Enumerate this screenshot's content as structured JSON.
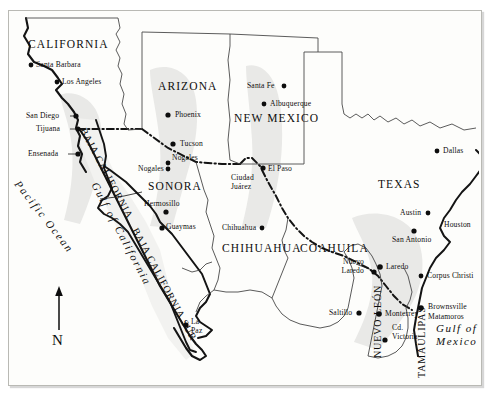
{
  "map": {
    "title": "US-Mexico Border Region Map",
    "frame": {
      "background": "#fdfdfb",
      "border_color": "#b9b9b4"
    },
    "compass": {
      "label": "N",
      "direction": "north"
    },
    "states_us": [
      {
        "name": "CALIFORNIA",
        "x": 28,
        "y": 44
      },
      {
        "name": "ARIZONA",
        "x": 158,
        "y": 86
      },
      {
        "name": "NEW MEXICO",
        "x": 234,
        "y": 118
      },
      {
        "name": "TEXAS",
        "x": 378,
        "y": 184
      }
    ],
    "states_mx": [
      {
        "name": "BAJA CALIFORNIA",
        "x": 88,
        "y": 130,
        "rotated": true
      },
      {
        "name": "BAJA CALIFORNIA SUR",
        "x": 118,
        "y": 238,
        "rotated": true
      },
      {
        "name": "SONORA",
        "x": 153,
        "y": 186
      },
      {
        "name": "CHIHUAHUA",
        "x": 228,
        "y": 248
      },
      {
        "name": "COAHUILA",
        "x": 305,
        "y": 248
      },
      {
        "name": "NUEVO LEÓN",
        "x": 368,
        "y": 292,
        "rotated": true
      },
      {
        "name": "TAMAULIPAS",
        "x": 412,
        "y": 300,
        "rotated": true
      }
    ],
    "cities_us": [
      {
        "name": "Santa Barbara",
        "x": 36,
        "y": 62,
        "dot_x": 31,
        "dot_y": 65,
        "anchor": "left"
      },
      {
        "name": "Los Angeles",
        "x": 62,
        "y": 79,
        "dot_x": 57,
        "dot_y": 82,
        "anchor": "left"
      },
      {
        "name": "San Diego",
        "x": 36,
        "y": 112,
        "dot_x": 76,
        "dot_y": 116,
        "anchor": "left"
      },
      {
        "name": "Phoenix",
        "x": 175,
        "y": 112,
        "dot_x": 168,
        "dot_y": 115,
        "anchor": "left"
      },
      {
        "name": "Tucson",
        "x": 180,
        "y": 141,
        "dot_x": 173,
        "dot_y": 144,
        "anchor": "left"
      },
      {
        "name": "Nogales",
        "x": 172,
        "y": 155,
        "dot_x": 168,
        "dot_y": 164,
        "anchor": "left"
      },
      {
        "name": "Santa Fe",
        "x": 247,
        "y": 83,
        "dot_x": 284,
        "dot_y": 86,
        "anchor": "left"
      },
      {
        "name": "Albuquerque",
        "x": 270,
        "y": 101,
        "dot_x": 264,
        "dot_y": 104,
        "anchor": "left"
      },
      {
        "name": "El Paso",
        "x": 268,
        "y": 166,
        "dot_x": 262,
        "dot_y": 169,
        "anchor": "left"
      },
      {
        "name": "Dallas",
        "x": 443,
        "y": 148,
        "dot_x": 437,
        "dot_y": 151,
        "anchor": "left"
      },
      {
        "name": "Austin",
        "x": 400,
        "y": 210,
        "dot_x": 428,
        "dot_y": 213,
        "anchor": "left"
      },
      {
        "name": "Houston",
        "x": 444,
        "y": 222,
        "dot_x": 483,
        "dot_y": 225,
        "anchor": "left"
      },
      {
        "name": "San Antonio",
        "x": 394,
        "y": 238,
        "dot_x": 414,
        "dot_y": 231,
        "anchor": "left"
      },
      {
        "name": "Laredo",
        "x": 386,
        "y": 264,
        "dot_x": 380,
        "dot_y": 267,
        "anchor": "left"
      },
      {
        "name": "Corpus Christi",
        "x": 427,
        "y": 273,
        "dot_x": 421,
        "dot_y": 276,
        "anchor": "left"
      },
      {
        "name": "Brownsville",
        "x": 428,
        "y": 305,
        "dot_x": 421,
        "dot_y": 310,
        "anchor": "left"
      }
    ],
    "cities_mx": [
      {
        "name": "Tijuana",
        "x": 39,
        "y": 126,
        "dot_x": 78,
        "dot_y": 129,
        "anchor": "left"
      },
      {
        "name": "Ensenada",
        "x": 33,
        "y": 151,
        "dot_x": 78,
        "dot_y": 154,
        "anchor": "left"
      },
      {
        "name": "Nogales",
        "x": 140,
        "y": 166,
        "dot_x": 168,
        "dot_y": 169,
        "anchor": "left"
      },
      {
        "name": "Hermosillo",
        "x": 146,
        "y": 202,
        "dot_x": 166,
        "dot_y": 212,
        "anchor": "left"
      },
      {
        "name": "Guaymas",
        "x": 152,
        "y": 230,
        "dot_x": 162,
        "dot_y": 228,
        "anchor": "left"
      },
      {
        "name": "Ciudad Juárez",
        "x": 231,
        "y": 176,
        "anchor": "left",
        "lines": [
          "Ciudad",
          "Juárez"
        ]
      },
      {
        "name": "Chihuahua",
        "x": 222,
        "y": 225,
        "dot_x": 262,
        "dot_y": 228,
        "anchor": "left"
      },
      {
        "name": "Nuevo Laredo",
        "x": 330,
        "y": 261,
        "anchor": "left",
        "lines": [
          "Nuevo",
          "Laredo"
        ]
      },
      {
        "name": "Saltillo",
        "x": 329,
        "y": 310,
        "dot_x": 359,
        "dot_y": 313,
        "anchor": "left"
      },
      {
        "name": "Monterrey",
        "x": 385,
        "y": 311,
        "dot_x": 379,
        "dot_y": 314,
        "anchor": "left"
      },
      {
        "name": "Cd. Victoria",
        "x": 390,
        "y": 332,
        "anchor": "left",
        "lines": [
          "Cd.",
          "Victoria"
        ]
      },
      {
        "name": "Matamoros",
        "x": 428,
        "y": 314,
        "anchor": "left"
      },
      {
        "name": "La Paz",
        "x": 190,
        "y": 323,
        "anchor": "left",
        "lines": [
          "La",
          "Paz"
        ]
      }
    ],
    "waters": [
      {
        "name": "Pacific Ocean",
        "x": 24,
        "y": 180,
        "rotation": 52
      },
      {
        "name": "Gulf of California",
        "x": 100,
        "y": 182,
        "rotation": 62
      },
      {
        "name": "Gulf of Mexico",
        "x": 436,
        "y": 325,
        "lines": [
          "Gulf of",
          "Mexico"
        ]
      }
    ],
    "legend_notes": {
      "border_line": "international border (dash-dot)",
      "shaded_zone": "border corridor shading"
    },
    "colors": {
      "land": "#fdfdfb",
      "mexico_fill": "#efefed",
      "shade": "#e8e8e6",
      "line": "#1a1a1a",
      "thin_line": "#3a3a3a"
    }
  }
}
